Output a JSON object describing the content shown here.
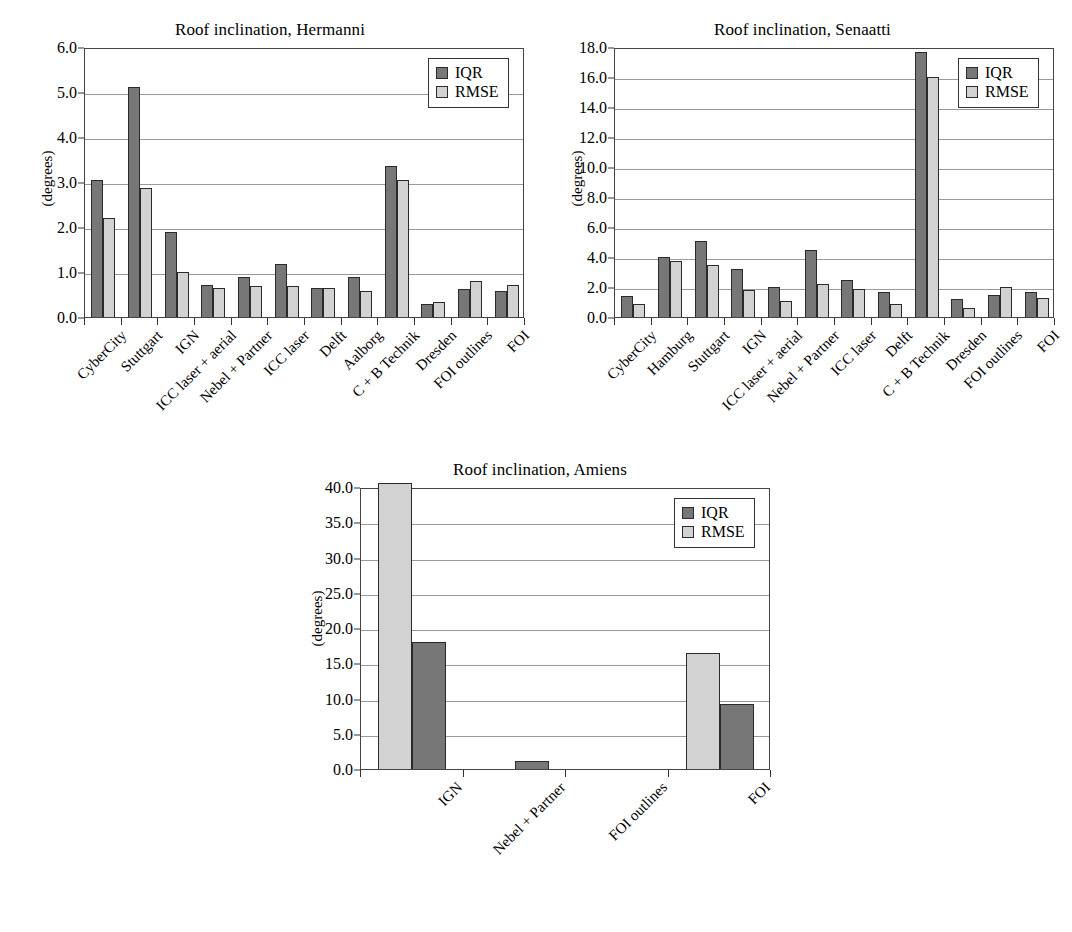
{
  "figure": {
    "ylabel": "(degrees)",
    "legend": {
      "iqr_label": "IQR",
      "rmse_label": "RMSE"
    },
    "colors": {
      "iqr": "#777777",
      "rmse": "#d2d2d2",
      "axis": "#444444",
      "grid": "#9a9a9a"
    }
  },
  "chart_data": [
    {
      "type": "bar",
      "id": "hermanni",
      "title": "Roof inclination, Hermanni",
      "xlabel": "",
      "ylabel": "(degrees)",
      "ylim": [
        0.0,
        6.0
      ],
      "yticks": [
        "0.0",
        "1.0",
        "2.0",
        "3.0",
        "4.0",
        "5.0",
        "6.0"
      ],
      "ytick_values": [
        0.0,
        1.0,
        2.0,
        3.0,
        4.0,
        5.0,
        6.0
      ],
      "grid": true,
      "legend_position": "top-right",
      "series_order": [
        "IQR",
        "RMSE"
      ],
      "categories": [
        "CyberCity",
        "Stuttgart",
        "IGN",
        "ICC laser + aerial",
        "Nebel + Partner",
        "ICC laser",
        "Delft",
        "Aalborg",
        "C + B Technik",
        "Dresden",
        "FOI outlines",
        "FOI"
      ],
      "series": [
        {
          "name": "IQR",
          "values": [
            3.05,
            5.12,
            1.88,
            0.72,
            0.9,
            1.17,
            0.65,
            0.9,
            3.36,
            0.29,
            0.62,
            0.58
          ]
        },
        {
          "name": "RMSE",
          "values": [
            2.19,
            2.87,
            1.0,
            0.65,
            0.69,
            0.68,
            0.65,
            0.58,
            3.04,
            0.33,
            0.81,
            0.72
          ]
        }
      ]
    },
    {
      "type": "bar",
      "id": "senaatti",
      "title": "Roof inclination, Senaatti",
      "xlabel": "",
      "ylabel": "(degrees)",
      "ylim": [
        0.0,
        18.0
      ],
      "yticks": [
        "0.0",
        "2.0",
        "4.0",
        "6.0",
        "8.0",
        "10.0",
        "12.0",
        "14.0",
        "16.0",
        "18.0"
      ],
      "ytick_values": [
        0.0,
        2.0,
        4.0,
        6.0,
        8.0,
        10.0,
        12.0,
        14.0,
        16.0,
        18.0
      ],
      "grid": true,
      "legend_position": "top-right",
      "series_order": [
        "IQR",
        "RMSE"
      ],
      "categories": [
        "CyberCity",
        "Hamburg",
        "Stuttgart",
        "IGN",
        "ICC laser + aerial",
        "Nebel + Partner",
        "ICC laser",
        "Delft",
        "C + B Technik",
        "Dresden",
        "FOI outlines",
        "FOI"
      ],
      "series": [
        {
          "name": "IQR",
          "values": [
            1.4,
            4.0,
            5.05,
            3.2,
            2.0,
            4.5,
            2.5,
            1.7,
            17.7,
            1.2,
            1.5,
            1.7
          ]
        },
        {
          "name": "RMSE",
          "values": [
            0.9,
            3.75,
            3.5,
            1.8,
            1.1,
            2.2,
            1.9,
            0.9,
            16.0,
            0.6,
            2.0,
            1.3
          ]
        }
      ]
    },
    {
      "type": "bar",
      "id": "amiens",
      "title": "Roof inclination, Amiens",
      "xlabel": "",
      "ylabel": "(degrees)",
      "ylim": [
        0.0,
        40.0
      ],
      "yticks": [
        "0.0",
        "5.0",
        "10.0",
        "15.0",
        "20.0",
        "25.0",
        "30.0",
        "35.0",
        "40.0"
      ],
      "ytick_values": [
        0.0,
        5.0,
        10.0,
        15.0,
        20.0,
        25.0,
        30.0,
        35.0,
        40.0
      ],
      "grid": true,
      "legend_position": "top-right",
      "series_order": [
        "RMSE",
        "IQR"
      ],
      "categories": [
        "IGN",
        "Nebel + Partner",
        "FOI outlines",
        "FOI"
      ],
      "series": [
        {
          "name": "RMSE",
          "values": [
            40.5,
            0.0,
            0.0,
            16.5
          ]
        },
        {
          "name": "IQR",
          "values": [
            18.0,
            1.2,
            0.0,
            9.2
          ]
        }
      ]
    }
  ]
}
